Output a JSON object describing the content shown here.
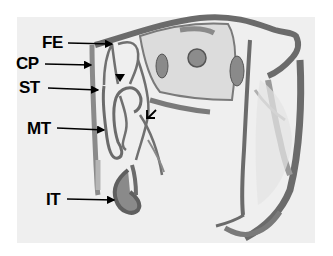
{
  "figure": {
    "labels": [
      {
        "id": "FE",
        "text": "FE",
        "x": 42,
        "y": 34,
        "arrow": [
          68,
          43,
          112,
          44
        ]
      },
      {
        "id": "CP",
        "text": "CP",
        "x": 16,
        "y": 55,
        "arrow": [
          45,
          64,
          91,
          65
        ]
      },
      {
        "id": "ST",
        "text": "ST",
        "x": 19,
        "y": 79,
        "arrow": [
          48,
          88,
          98,
          90
        ]
      },
      {
        "id": "MT",
        "text": "MT",
        "x": 27,
        "y": 120,
        "arrow": [
          57,
          128,
          104,
          130
        ]
      },
      {
        "id": "IT",
        "text": "IT",
        "x": 46,
        "y": 191,
        "arrow": [
          67,
          199,
          114,
          200
        ]
      }
    ],
    "markers": [
      {
        "type": "filled-arrowhead",
        "x": 120,
        "y": 79
      },
      {
        "type": "open-arrow",
        "x": 150,
        "y": 112
      }
    ],
    "colors": {
      "background": "#efefef",
      "tissue_dark": "#6b6b6b",
      "tissue_mid": "#9a9a9a",
      "tissue_light": "#d6d6d6",
      "label": "#000000"
    }
  }
}
